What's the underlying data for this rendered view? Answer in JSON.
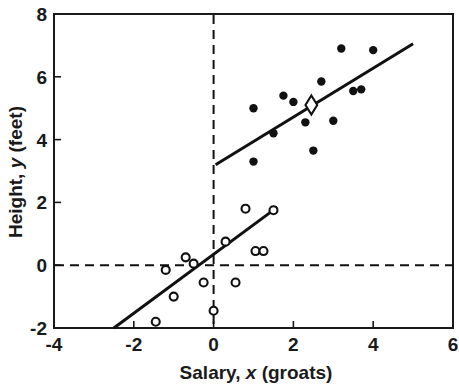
{
  "chart_data": {
    "type": "scatter",
    "title": "",
    "xlabel": "Salary, x (groats)",
    "ylabel": "Height, y (feet)",
    "xlabel_parts": {
      "prefix": "Salary,",
      "symbol": "x",
      "suffix": "(groats)"
    },
    "ylabel_parts": {
      "prefix": "Height,",
      "symbol": "y",
      "suffix": "(feet)"
    },
    "xlim": [
      -4,
      6
    ],
    "ylim": [
      -2,
      8
    ],
    "xticks": [
      -4,
      -2,
      0,
      2,
      4,
      6
    ],
    "yticks": [
      -2,
      0,
      2,
      4,
      6,
      8
    ],
    "xtick_labels": [
      "-4",
      "-2",
      "0",
      "2",
      "4",
      "6"
    ],
    "ytick_labels": [
      "-2",
      "0",
      "2",
      "4",
      "6",
      "8"
    ],
    "grid": false,
    "legend": "none",
    "reference_lines": [
      {
        "name": "horizontal-zero-line",
        "orientation": "horizontal",
        "value": 0,
        "style": "dashed"
      },
      {
        "name": "vertical-zero-line",
        "orientation": "vertical",
        "value": 0,
        "style": "dashed"
      }
    ],
    "series": [
      {
        "name": "upper-group-filled",
        "marker": "filled-circle",
        "color": "#111111",
        "points": [
          {
            "x": 1.0,
            "y": 5.0
          },
          {
            "x": 1.0,
            "y": 3.3
          },
          {
            "x": 1.5,
            "y": 4.2
          },
          {
            "x": 1.75,
            "y": 5.4
          },
          {
            "x": 2.0,
            "y": 5.2
          },
          {
            "x": 2.3,
            "y": 4.55
          },
          {
            "x": 2.5,
            "y": 3.65
          },
          {
            "x": 2.7,
            "y": 5.85
          },
          {
            "x": 3.0,
            "y": 4.6
          },
          {
            "x": 3.2,
            "y": 6.9
          },
          {
            "x": 3.5,
            "y": 5.55
          },
          {
            "x": 3.7,
            "y": 5.6
          },
          {
            "x": 4.0,
            "y": 6.85
          }
        ]
      },
      {
        "name": "lower-group-open",
        "marker": "open-circle",
        "color": "#111111",
        "points": [
          {
            "x": -1.45,
            "y": -1.8
          },
          {
            "x": -1.2,
            "y": -0.15
          },
          {
            "x": -1.0,
            "y": -1.0
          },
          {
            "x": -0.7,
            "y": 0.25
          },
          {
            "x": -0.5,
            "y": 0.05
          },
          {
            "x": -0.25,
            "y": -0.55
          },
          {
            "x": 0.0,
            "y": -1.45
          },
          {
            "x": 0.3,
            "y": 0.75
          },
          {
            "x": 0.55,
            "y": -0.55
          },
          {
            "x": 0.8,
            "y": 1.8
          },
          {
            "x": 1.05,
            "y": 0.45
          },
          {
            "x": 1.25,
            "y": 0.45
          },
          {
            "x": 1.5,
            "y": 1.75
          }
        ]
      },
      {
        "name": "highlighted-diamond",
        "marker": "open-diamond",
        "color": "#111111",
        "points": [
          {
            "x": 2.45,
            "y": 5.1
          }
        ]
      }
    ],
    "fit_lines": [
      {
        "name": "upper-regression-line",
        "x0": 0.05,
        "y0": 3.2,
        "x1": 5.0,
        "y1": 7.05
      },
      {
        "name": "lower-regression-line",
        "x0": -2.5,
        "y0": -2.0,
        "x1": 1.6,
        "y1": 1.85
      }
    ]
  }
}
